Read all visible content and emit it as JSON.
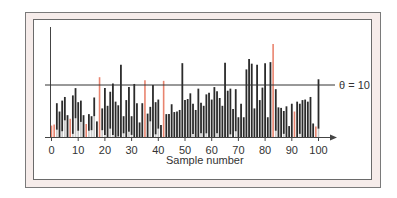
{
  "chart_data": {
    "type": "bar",
    "title": "",
    "xlabel": "Sample number",
    "ylabel": "",
    "xlim": [
      0,
      100
    ],
    "ylim": [
      0,
      21
    ],
    "grid": false,
    "legend": null,
    "x_ticks": [
      0,
      10,
      20,
      30,
      40,
      50,
      60,
      70,
      80,
      90,
      100
    ],
    "x_tick_labels": [
      "0",
      "10",
      "20",
      "30",
      "40",
      "50",
      "60",
      "70",
      "80",
      "90",
      "100"
    ],
    "threshold": {
      "value": 10,
      "label": "θ = 10"
    },
    "x": [
      0,
      1,
      2,
      3,
      4,
      5,
      6,
      7,
      8,
      9,
      10,
      11,
      12,
      13,
      14,
      15,
      16,
      17,
      18,
      19,
      20,
      21,
      22,
      23,
      24,
      25,
      26,
      27,
      28,
      29,
      30,
      31,
      32,
      33,
      34,
      35,
      36,
      37,
      38,
      39,
      40,
      41,
      42,
      43,
      44,
      45,
      46,
      47,
      48,
      49,
      50,
      51,
      52,
      53,
      54,
      55,
      56,
      57,
      58,
      59,
      60,
      61,
      62,
      63,
      64,
      65,
      66,
      67,
      68,
      69,
      70,
      71,
      72,
      73,
      74,
      75,
      76,
      77,
      78,
      79,
      80,
      81,
      82,
      83,
      84,
      85,
      86,
      87,
      88,
      89,
      90,
      91,
      92,
      93,
      94,
      95,
      96,
      97,
      98,
      99,
      100
    ],
    "values": [
      2.2,
      2.4,
      6.5,
      4.9,
      7.0,
      7.7,
      4.2,
      3.5,
      8.0,
      9.4,
      6.7,
      7.0,
      4.2,
      2.5,
      4.4,
      4.0,
      7.6,
      3.0,
      11.5,
      5.5,
      9.4,
      6.0,
      8.7,
      10.3,
      6.8,
      6.1,
      13.9,
      4.0,
      7.1,
      9.6,
      4.0,
      10.2,
      6.5,
      2.8,
      6.5,
      10.9,
      4.5,
      5.8,
      10.0,
      6.7,
      7.2,
      2.3,
      10.8,
      4.4,
      4.4,
      6.3,
      4.8,
      4.9,
      5.2,
      14.2,
      7.1,
      7.3,
      8.4,
      6.4,
      5.2,
      9.3,
      6.6,
      6.0,
      8.2,
      8.5,
      7.2,
      9.6,
      8.8,
      7.5,
      6.0,
      14.3,
      8.9,
      9.3,
      5.4,
      9.2,
      3.8,
      6.4,
      3.8,
      13.0,
      15.0,
      14.1,
      5.5,
      13.9,
      7.1,
      9.5,
      14.2,
      3.8,
      14.4,
      17.9,
      9.2,
      5.7,
      5.6,
      5.0,
      5.9,
      2.1,
      6.4,
      4.9,
      6.8,
      6.4,
      7.1,
      7.2,
      6.8,
      7.7,
      2.6,
      2.0,
      11.1
    ],
    "low": [
      0,
      0,
      1.4,
      0,
      1.1,
      3.2,
      0,
      0,
      0.6,
      3.6,
      1.2,
      2.9,
      0,
      0,
      1.2,
      1.3,
      4.0,
      0,
      0,
      1.3,
      0.4,
      0,
      1.6,
      0.4,
      0,
      0.1,
      0,
      0.7,
      0,
      1.0,
      0.4,
      0,
      0,
      0,
      0,
      0,
      0,
      3.0,
      0,
      0.5,
      1.6,
      0,
      0,
      0,
      0,
      0,
      0,
      0,
      0,
      0,
      0,
      0,
      0,
      0.6,
      0,
      0,
      0.7,
      0,
      0.7,
      0,
      0,
      0,
      0.7,
      0,
      0,
      0,
      0,
      0.5,
      0,
      1.1,
      0,
      0,
      0,
      0,
      0,
      0,
      0,
      0,
      0,
      0,
      0,
      0,
      0,
      0,
      1.2,
      0,
      0,
      0.6,
      0,
      0,
      0,
      0,
      0,
      0.6,
      0,
      0,
      0,
      0,
      0,
      0,
      1.6
    ],
    "highlighted_low_samples": [
      0,
      1,
      7,
      13,
      18,
      35,
      42,
      83,
      91,
      99
    ],
    "colors": {
      "bar": "#2b2b2b",
      "highlight": "#e9846f",
      "threshold": "#333333",
      "frame_bg": "#f6ecea"
    }
  }
}
